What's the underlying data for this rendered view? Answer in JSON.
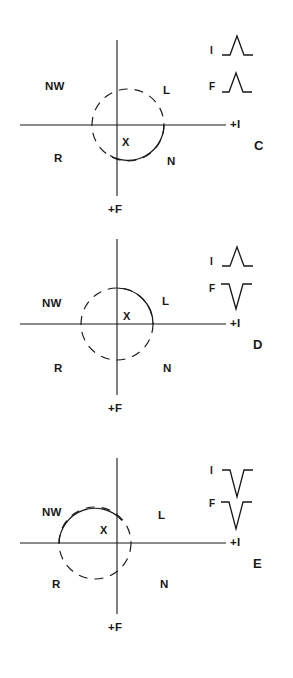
{
  "figure": {
    "ink_color": "#181818",
    "background_color": "#ffffff",
    "panels": [
      {
        "letter": "C",
        "axis_labels": {
          "horizontal": "+I",
          "vertical": "+F"
        },
        "center_label": "X",
        "quadrant_labels": {
          "upper_left": "NW",
          "upper_right": "L",
          "lower_left": "R",
          "lower_right": "N"
        },
        "loop": {
          "center_x_offset": 11,
          "center_y_offset": 0,
          "radius": 36,
          "solid_arc_start_deg": 0,
          "solid_arc_end_deg": 180,
          "description": "loop displaced right; solid inscription through N quadrant"
        },
        "waveforms": [
          {
            "lead": "I",
            "shape": "upward-peak"
          },
          {
            "lead": "F",
            "shape": "upward-peak"
          }
        ]
      },
      {
        "letter": "D",
        "axis_labels": {
          "horizontal": "+I",
          "vertical": "+F"
        },
        "center_label": "X",
        "quadrant_labels": {
          "upper_left": "NW",
          "upper_right": "L",
          "lower_left": "R",
          "lower_right": "N"
        },
        "loop": {
          "center_x_offset": 0,
          "center_y_offset": 0,
          "radius": 36,
          "solid_arc_start_deg": 270,
          "solid_arc_end_deg": 360,
          "description": "loop centered on origin; solid inscription through L quadrant"
        },
        "waveforms": [
          {
            "lead": "I",
            "shape": "upward-peak"
          },
          {
            "lead": "F",
            "shape": "downward-trough"
          }
        ]
      },
      {
        "letter": "E",
        "axis_labels": {
          "horizontal": "+I",
          "vertical": "+F"
        },
        "center_label": "X",
        "quadrant_labels": {
          "upper_left": "NW",
          "upper_right": "L",
          "lower_left": "R",
          "lower_right": "N"
        },
        "loop": {
          "center_x_offset": -22,
          "center_y_offset": 0,
          "radius": 36,
          "solid_arc_start_deg": 180,
          "solid_arc_end_deg": 270,
          "description": "loop displaced left; solid inscription through NW quadrant"
        },
        "waveforms": [
          {
            "lead": "I",
            "shape": "downward-trough"
          },
          {
            "lead": "F",
            "shape": "downward-trough"
          }
        ]
      }
    ]
  }
}
